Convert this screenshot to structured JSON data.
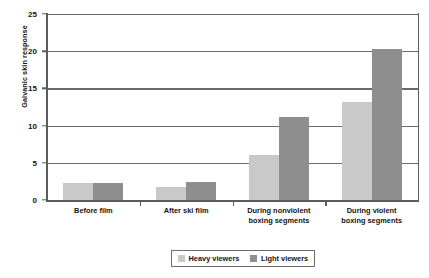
{
  "chart_data": {
    "type": "bar",
    "title": "",
    "xlabel": "",
    "ylabel": "Galvanic skin response",
    "ylim": [
      0,
      25
    ],
    "yticks": [
      0,
      5,
      10,
      15,
      20,
      25
    ],
    "ytick_labels": [
      "0",
      "5",
      "10",
      "15",
      "20",
      "25"
    ],
    "grid": "horizontal",
    "legend_position": "bottom-center",
    "categories": [
      "Before film",
      "After ski film",
      "During nonviolent boxing segments",
      "During violent boxing segments"
    ],
    "category_lines": [
      [
        "Before film"
      ],
      [
        "After ski film"
      ],
      [
        "During nonviolent",
        "boxing segments"
      ],
      [
        "During violent",
        "boxing segments"
      ]
    ],
    "series": [
      {
        "name": "Heavy viewers",
        "color": "#c9c9c9",
        "values": [
          2.3,
          1.8,
          6.0,
          13.2
        ]
      },
      {
        "name": "Light viewers",
        "color": "#8e8e8e",
        "values": [
          2.3,
          2.4,
          11.2,
          20.3
        ]
      }
    ]
  },
  "legend": {
    "entries": [
      {
        "label": "Heavy viewers",
        "swatch": "heavy"
      },
      {
        "label": "Light viewers",
        "swatch": "light"
      }
    ]
  },
  "colors": {
    "heavy_viewers": "#c9c9c9",
    "light_viewers": "#8e8e8e",
    "axis": "#5c5c5c",
    "gridline": "#6b6b6b",
    "text": "#141414",
    "background": "#ffffff"
  }
}
